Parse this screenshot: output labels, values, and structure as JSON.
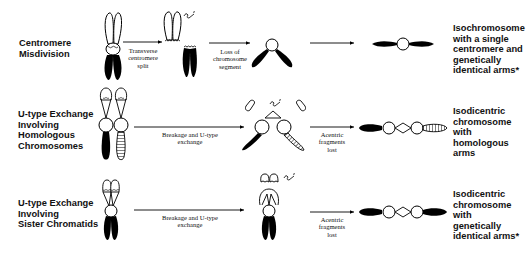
{
  "rows": [
    {
      "label": [
        "Centromere",
        "Misdivision"
      ],
      "steps": [
        {
          "arrow_label": [
            "Transverse",
            "centromere",
            "split"
          ]
        },
        {
          "arrow_label": [
            "Loss of",
            "chromosome",
            "segment"
          ]
        },
        {
          "arrow_label": []
        }
      ],
      "result": [
        "Isochromosome",
        "with a single",
        "centromere and",
        "genetically",
        "identical arms*"
      ]
    },
    {
      "label": [
        "U-type Exchange",
        "Involving",
        "Homologous",
        "Chromosomes"
      ],
      "steps": [
        {
          "arrow_label": [
            "Breakage and U-type",
            "exchange"
          ]
        },
        {
          "arrow_label": [
            "Acentric",
            "fragments",
            "lost"
          ]
        }
      ],
      "result": [
        "Isodicentric",
        "chromosome",
        "with",
        "homologous",
        "arms"
      ]
    },
    {
      "label": [
        "U-type Exchange",
        "Involving",
        "Sister Chromatids"
      ],
      "steps": [
        {
          "arrow_label": [
            "Breakage and U-type",
            "exchange"
          ]
        },
        {
          "arrow_label": [
            "Acentric",
            "fragments",
            "lost"
          ]
        }
      ],
      "result": [
        "Isodicentric",
        "chromosome",
        "with",
        "genetically",
        "identical arms*"
      ]
    }
  ],
  "colors": {
    "ink": "#000000",
    "background": "#ffffff"
  }
}
